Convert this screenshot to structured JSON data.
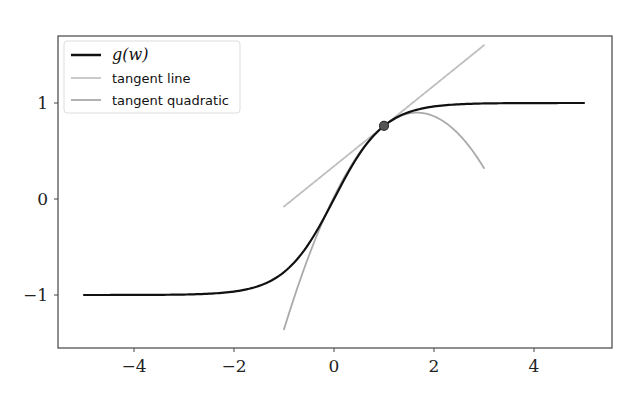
{
  "chart_data": {
    "type": "line",
    "title": "",
    "xlabel": "",
    "ylabel": "",
    "xlim": [
      -5.5,
      5.55
    ],
    "ylim": [
      -1.54,
      1.7
    ],
    "xticks": [
      -4,
      -2,
      0,
      2,
      4
    ],
    "xtick_labels": [
      "−4",
      "−2",
      "0",
      "2",
      "4"
    ],
    "yticks": [
      -1,
      0,
      1
    ],
    "ytick_labels": [
      "−1",
      "0",
      "1"
    ],
    "grid": false,
    "legend_position": "upper left",
    "series": [
      {
        "name": "g(w)",
        "label_display": "g(w)",
        "function": "tanh(w)",
        "color": "#111111",
        "width": 2.2,
        "x": [
          -5,
          -4,
          -3,
          -2,
          -1.5,
          -1,
          -0.5,
          0,
          0.5,
          1,
          1.5,
          2,
          3,
          4,
          5
        ],
        "y": [
          -1.0,
          -0.999,
          -0.995,
          -0.964,
          -0.905,
          -0.762,
          -0.462,
          0,
          0.462,
          0.762,
          0.905,
          0.964,
          0.995,
          0.999,
          1.0
        ]
      },
      {
        "name": "tangent line",
        "label_display": "tangent line",
        "color": "#bfbfbf",
        "width": 1.8,
        "x": [
          -1,
          3
        ],
        "y": [
          -0.08,
          1.6
        ]
      },
      {
        "name": "tangent quadratic",
        "label_display": "tangent quadratic",
        "color": "#aaaaaa",
        "width": 1.8,
        "x": [
          -1,
          -0.5,
          0,
          0.5,
          1,
          1.5,
          2,
          2.5,
          3
        ],
        "y": [
          -1.36,
          -0.71,
          -0.14,
          0.35,
          0.76,
          1.09,
          1.34,
          1.51,
          0.32
        ]
      }
    ],
    "annotations": [
      {
        "type": "point",
        "x": 1,
        "y": 0.762,
        "color": "#555555",
        "edge": "#333333"
      }
    ]
  },
  "legend": {
    "items": [
      {
        "label": "g(w)",
        "color": "#111111"
      },
      {
        "label": "tangent line",
        "color": "#c4c4c4"
      },
      {
        "label": "tangent quadratic",
        "color": "#aaaaaa"
      }
    ]
  }
}
